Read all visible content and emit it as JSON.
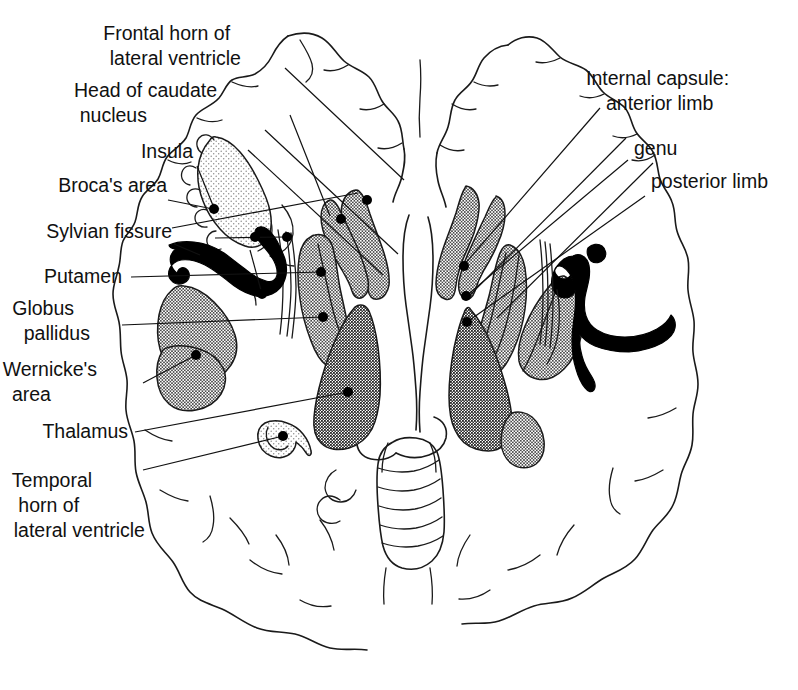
{
  "figure": {
    "background_color": "#ffffff",
    "ink_color": "#111111",
    "width": 798,
    "height": 690
  },
  "labels_left": [
    {
      "id": "frontal-horn",
      "lines": [
        "Frontal horn of",
        "lateral ventricle"
      ],
      "x": 268,
      "y": 40
    },
    {
      "id": "head-of-caudate",
      "lines": [
        "Head of caudate",
        "nucleus"
      ],
      "x": 165,
      "y": 97
    },
    {
      "id": "insula",
      "lines": [
        "Insula"
      ],
      "x": 143,
      "y": 158
    },
    {
      "id": "brocas-area",
      "lines": [
        "Broca's area"
      ],
      "x": 160,
      "y": 192
    },
    {
      "id": "sylvian-fissure",
      "lines": [
        "Sylvian fissure"
      ],
      "x": 166,
      "y": 238
    },
    {
      "id": "putamen",
      "lines": [
        "Putamen"
      ],
      "x": 122,
      "y": 277
    },
    {
      "id": "globus-pallidus",
      "lines": [
        "Globus",
        "pallidus"
      ],
      "x": 104,
      "y": 315
    },
    {
      "id": "wernickes-area",
      "lines": [
        "Wernicke's",
        "area"
      ],
      "x": 134,
      "y": 376
    },
    {
      "id": "thalamus",
      "lines": [
        "Thalamus"
      ],
      "x": 128,
      "y": 436
    },
    {
      "id": "temporal-horn",
      "lines": [
        "Temporal",
        "horn of",
        "lateral ventricle"
      ],
      "x": 148,
      "y": 487
    }
  ],
  "labels_right": [
    {
      "id": "internal-capsule",
      "lines": [
        "Internal capsule:",
        "anterior limb"
      ],
      "x": 586,
      "y": 85
    },
    {
      "id": "genu",
      "lines": [
        "genu"
      ],
      "x": 634,
      "y": 155
    },
    {
      "id": "posterior-limb",
      "lines": [
        "posterior limb"
      ],
      "x": 651,
      "y": 188
    }
  ],
  "structures": [
    {
      "id": "insula-region",
      "name": "Insula / Broca's area stipple",
      "fill": "light-stipple"
    },
    {
      "id": "caudate-head-left",
      "name": "Head of caudate nucleus (left)",
      "fill": "medium-stipple"
    },
    {
      "id": "caudate-head-right",
      "name": "Head of caudate nucleus (right)",
      "fill": "medium-stipple"
    },
    {
      "id": "putamen-left",
      "name": "Putamen (left)",
      "fill": "medium-stipple"
    },
    {
      "id": "putamen-right",
      "name": "Putamen (right)",
      "fill": "medium-stipple"
    },
    {
      "id": "globus-pallidus-left",
      "name": "Globus pallidus (left)",
      "fill": "medium-stipple"
    },
    {
      "id": "globus-pallidus-right",
      "name": "Globus pallidus (right)",
      "fill": "medium-stipple"
    },
    {
      "id": "thalamus-left",
      "name": "Thalamus (left)",
      "fill": "dark-stipple"
    },
    {
      "id": "thalamus-right",
      "name": "Thalamus (right)",
      "fill": "dark-stipple"
    },
    {
      "id": "wernicke-region",
      "name": "Wernicke's area",
      "fill": "medium-stipple"
    },
    {
      "id": "temporal-horn-left",
      "name": "Temporal horn of lateral ventricle",
      "fill": "light-stipple"
    },
    {
      "id": "sylvian-fissure-left",
      "name": "Sylvian fissure (left)",
      "fill": "solid-black"
    },
    {
      "id": "sylvian-fissure-right",
      "name": "Sylvian fissure (right)",
      "fill": "solid-black"
    },
    {
      "id": "tail-region-right",
      "name": "Tail of caudate (right)",
      "fill": "light-stipple"
    }
  ]
}
